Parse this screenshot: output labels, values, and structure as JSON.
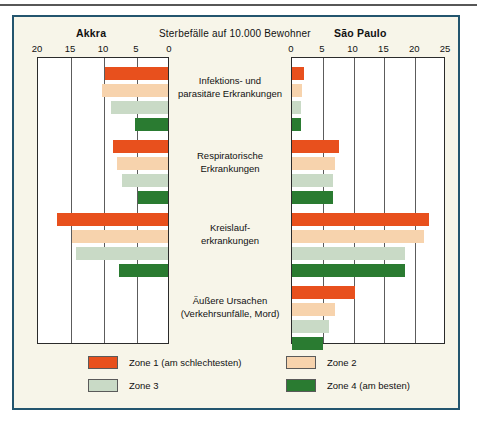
{
  "figure": {
    "center_title": "Sterbefälle auf 10.000 Bewohner",
    "left_title": "Akkra",
    "right_title": "São Paulo"
  },
  "legend": {
    "items": [
      {
        "label": "Zone 1 (am schlechtesten)",
        "color": "#e8501d"
      },
      {
        "label": "Zone 2",
        "color": "#f7d3ad"
      },
      {
        "label": "Zone 3",
        "color": "#c9dac6"
      },
      {
        "label": "Zone 4 (am besten)",
        "color": "#2a7b31"
      }
    ]
  },
  "chart_data": {
    "type": "bar",
    "orientation": "horizontal",
    "layout": "butterfly-paired-panels",
    "title": "Sterbefälle auf 10.000 Bewohner",
    "xlabel": "Sterbefälle auf 10.000 Bewohner",
    "ylabel": "",
    "grid": true,
    "legend_position": "bottom",
    "categories": [
      "Infektions- und parasitäre Erkrankungen",
      "Respiratorische Erkrankungen",
      "Kreislauf-erkrankungen",
      "Äußere Ursachen (Verkehrsunfälle, Mord)"
    ],
    "category_lines": [
      [
        "Infektions- und",
        "parasitäre Erkrankungen"
      ],
      [
        "Respiratorische",
        "Erkrankungen"
      ],
      [
        "Kreislauf-",
        "erkrankungen"
      ],
      [
        "Äußere Ursachen",
        "(Verkehrsunfälle, Mord)"
      ]
    ],
    "panels": [
      {
        "name": "Akkra",
        "side": "left",
        "xlim": [
          0,
          20
        ],
        "xticks": [
          20,
          15,
          10,
          5,
          0
        ],
        "direction": "right-to-left",
        "series": [
          {
            "name": "Zone 1 (am schlechtesten)",
            "color": "#e8501d",
            "values": [
              9.5,
              8.3,
              16.8,
              0
            ]
          },
          {
            "name": "Zone 2",
            "color": "#f7d3ad",
            "values": [
              10.0,
              7.7,
              14.5,
              0
            ]
          },
          {
            "name": "Zone 3",
            "color": "#c9dac6",
            "values": [
              8.7,
              7.0,
              14.0,
              0
            ]
          },
          {
            "name": "Zone 4 (am besten)",
            "color": "#2a7b31",
            "values": [
              5.0,
              4.6,
              7.5,
              0
            ]
          }
        ]
      },
      {
        "name": "São Paulo",
        "side": "right",
        "xlim": [
          0,
          25
        ],
        "xticks": [
          0,
          5,
          10,
          15,
          20,
          25
        ],
        "direction": "left-to-right",
        "series": [
          {
            "name": "Zone 1 (am schlechtesten)",
            "color": "#e8501d",
            "values": [
              2.0,
              7.7,
              22.3,
              10.2
            ]
          },
          {
            "name": "Zone 2",
            "color": "#f7d3ad",
            "values": [
              1.6,
              7.0,
              21.4,
              7.0
            ]
          },
          {
            "name": "Zone 3",
            "color": "#c9dac6",
            "values": [
              1.5,
              6.7,
              18.4,
              6.0
            ]
          },
          {
            "name": "Zone 4 (am besten)",
            "color": "#2a7b31",
            "values": [
              1.5,
              6.7,
              18.4,
              5.0
            ]
          }
        ]
      }
    ]
  }
}
